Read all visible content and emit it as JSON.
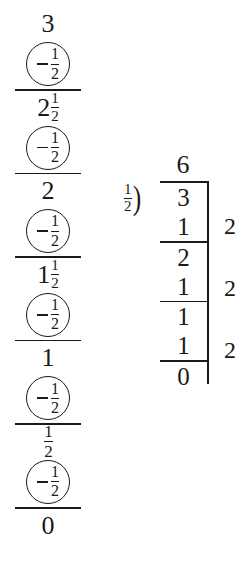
{
  "page": {
    "background": "#ffffff",
    "ink": "#1a1a1a"
  },
  "subtraction_column": {
    "label": "repeated subtraction of one half from three",
    "start_value": {
      "whole": "3",
      "numerator": "",
      "denominator": ""
    },
    "operator": {
      "sign": "−",
      "numerator": "1",
      "denominator": "2"
    },
    "steps": [
      {
        "result": {
          "whole": "2",
          "numerator": "1",
          "denominator": "2"
        }
      },
      {
        "result": {
          "whole": "2",
          "numerator": "",
          "denominator": ""
        }
      },
      {
        "result": {
          "whole": "1",
          "numerator": "1",
          "denominator": "2"
        }
      },
      {
        "result": {
          "whole": "1",
          "numerator": "",
          "denominator": ""
        }
      },
      {
        "result": {
          "whole": "",
          "numerator": "1",
          "denominator": "2"
        }
      },
      {
        "result": {
          "whole": "0",
          "numerator": "",
          "denominator": ""
        }
      }
    ]
  },
  "long_division": {
    "label": "long division of 3 by one half",
    "quotient": "6",
    "divisor": {
      "numerator": "1",
      "denominator": "2"
    },
    "division_hook": ")",
    "work_rows": [
      {
        "digit": "3",
        "rule_below": false
      },
      {
        "digit": "1",
        "rule_below": true
      },
      {
        "digit": "2",
        "rule_below": false
      },
      {
        "digit": "1",
        "rule_below": true
      },
      {
        "digit": "1",
        "rule_below": false
      },
      {
        "digit": "1",
        "rule_below": true
      },
      {
        "digit": "0",
        "rule_below": false
      }
    ],
    "count_column": [
      "2",
      "2",
      "2"
    ]
  }
}
